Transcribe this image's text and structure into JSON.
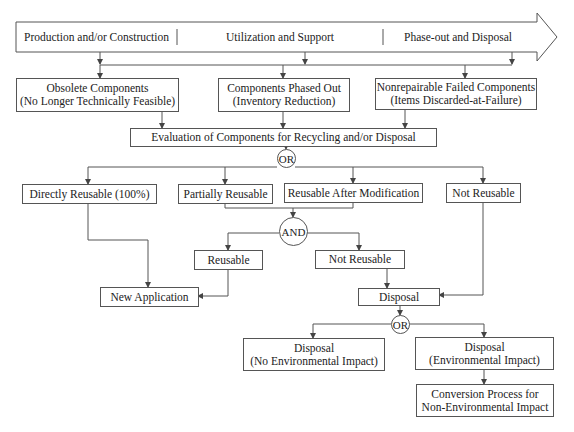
{
  "lifecycle_arrow": {
    "phases": [
      "Production and/or Construction",
      "Utilization and Support",
      "Phase-out and Disposal"
    ]
  },
  "sources": [
    {
      "line1": "Obsolete Components",
      "line2": "(No Longer Technically Feasible)"
    },
    {
      "line1": "Components Phased Out",
      "line2": "(Inventory Reduction)"
    },
    {
      "line1": "Nonrepairable Failed Components",
      "line2": "(Items Discarded-at-Failure)"
    }
  ],
  "evaluation": "Evaluation of Components for Recycling and/or Disposal",
  "gates": {
    "or1": "OR",
    "and1": "AND",
    "or2": "OR"
  },
  "categories": [
    "Directly Reusable (100%)",
    "Partially Reusable",
    "Reusable After Modification",
    "Not Reusable"
  ],
  "and_outcomes": {
    "reusable": "Reusable",
    "not_reusable": "Not Reusable"
  },
  "new_application": "New Application",
  "disposal": "Disposal",
  "disposal_options": [
    {
      "line1": "Disposal",
      "line2": "(No Environmental Impact)"
    },
    {
      "line1": "Disposal",
      "line2": "(Environmental Impact)"
    }
  ],
  "conversion": {
    "line1": "Conversion Process for",
    "line2": "Non-Environmental Impact"
  },
  "colors": {
    "line": "#555555",
    "text": "#222222",
    "background": "#ffffff"
  }
}
